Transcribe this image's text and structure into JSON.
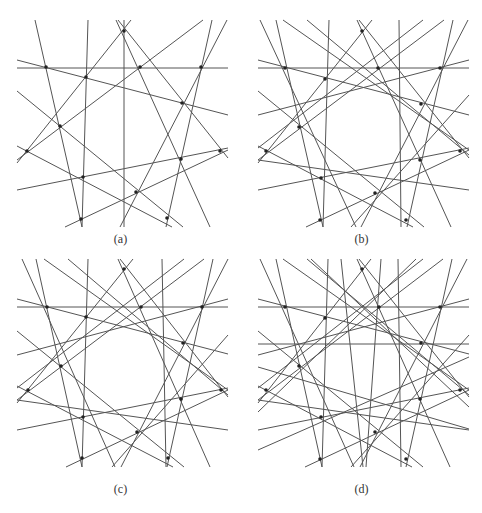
{
  "figure": {
    "stroke_color": "#555555",
    "dot_color": "#222222",
    "panels": [
      {
        "id": "a",
        "caption": "(a)",
        "offset": [
          0,
          0
        ],
        "caption_y": 232,
        "lines": [
          [
            17,
            68,
            228,
            68
          ],
          [
            17,
            60,
            228,
            115
          ],
          [
            35,
            20,
            82,
            227
          ],
          [
            88,
            20,
            82,
            227
          ],
          [
            124,
            20,
            124,
            227
          ],
          [
            116,
            20,
            210,
            227
          ],
          [
            118,
            20,
            228,
            158
          ],
          [
            131,
            20,
            17,
            163
          ],
          [
            203,
            20,
            17,
            160
          ],
          [
            212,
            20,
            166,
            227
          ],
          [
            227,
            20,
            120,
            227
          ],
          [
            17,
            91,
            183,
            227
          ],
          [
            17,
            190,
            228,
            148
          ],
          [
            65,
            227,
            228,
            150
          ],
          [
            17,
            146,
            172,
            227
          ]
        ],
        "dots": [
          [
            46,
            67
          ],
          [
            124,
            31
          ],
          [
            140,
            67
          ],
          [
            201,
            67
          ],
          [
            86,
            77
          ],
          [
            182,
            103
          ],
          [
            60,
            126
          ],
          [
            27,
            151
          ],
          [
            181,
            159
          ],
          [
            220,
            151
          ],
          [
            83,
            177
          ],
          [
            136,
            192
          ],
          [
            81,
            219
          ],
          [
            167,
            218
          ]
        ]
      },
      {
        "id": "b",
        "caption": "(b)",
        "offset": [
          241,
          0
        ],
        "caption_y": 232,
        "lines": [
          [
            17,
            68,
            228,
            68
          ],
          [
            17,
            60,
            228,
            115
          ],
          [
            35,
            20,
            82,
            227
          ],
          [
            88,
            20,
            82,
            227
          ],
          [
            116,
            20,
            210,
            227
          ],
          [
            118,
            20,
            228,
            158
          ],
          [
            131,
            20,
            17,
            163
          ],
          [
            203,
            20,
            17,
            160
          ],
          [
            212,
            20,
            166,
            227
          ],
          [
            227,
            20,
            120,
            227
          ],
          [
            17,
            91,
            183,
            227
          ],
          [
            17,
            190,
            228,
            148
          ],
          [
            65,
            227,
            228,
            150
          ],
          [
            17,
            146,
            172,
            227
          ],
          [
            19,
            20,
            115,
            227
          ],
          [
            42,
            20,
            228,
            150
          ],
          [
            17,
            115,
            228,
            60
          ],
          [
            17,
            160,
            228,
            190
          ],
          [
            158,
            20,
            160,
            227
          ],
          [
            228,
            95,
            110,
            227
          ],
          [
            17,
            148,
            182,
            20
          ],
          [
            228,
            155,
            66,
            20
          ]
        ],
        "dots": [
          [
            44,
            68
          ],
          [
            121,
            31
          ],
          [
            137,
            68
          ],
          [
            199,
            68
          ],
          [
            84,
            79
          ],
          [
            180,
            104
          ],
          [
            58,
            127
          ],
          [
            25,
            151
          ],
          [
            179,
            160
          ],
          [
            219,
            151
          ],
          [
            80,
            178
          ],
          [
            134,
            193
          ],
          [
            79,
            220
          ],
          [
            165,
            220
          ]
        ]
      },
      {
        "id": "c",
        "caption": "(c)",
        "offset": [
          0,
          247
        ],
        "caption_y": 235,
        "lines": [
          [
            17,
            60,
            228,
            60
          ],
          [
            17,
            52,
            228,
            107
          ],
          [
            36,
            12,
            82,
            220
          ],
          [
            88,
            12,
            82,
            220
          ],
          [
            118,
            12,
            210,
            220
          ],
          [
            120,
            12,
            228,
            150
          ],
          [
            133,
            12,
            17,
            156
          ],
          [
            204,
            12,
            17,
            153
          ],
          [
            213,
            12,
            167,
            220
          ],
          [
            228,
            12,
            121,
            220
          ],
          [
            17,
            84,
            184,
            220
          ],
          [
            17,
            183,
            228,
            141
          ],
          [
            66,
            220,
            228,
            143
          ],
          [
            17,
            139,
            173,
            220
          ],
          [
            22,
            12,
            115,
            220
          ],
          [
            44,
            12,
            228,
            143
          ],
          [
            17,
            108,
            228,
            52
          ],
          [
            17,
            153,
            228,
            183
          ],
          [
            162,
            12,
            166,
            220
          ],
          [
            228,
            88,
            112,
            220
          ],
          [
            17,
            141,
            184,
            12
          ],
          [
            228,
            148,
            68,
            12
          ]
        ],
        "dots": [
          [
            47,
            60
          ],
          [
            124,
            22
          ],
          [
            141,
            60
          ],
          [
            202,
            60
          ],
          [
            86,
            70
          ],
          [
            183,
            96
          ],
          [
            61,
            119
          ],
          [
            28,
            143
          ],
          [
            181,
            152
          ],
          [
            221,
            143
          ],
          [
            83,
            170
          ],
          [
            137,
            185
          ],
          [
            82,
            211
          ],
          [
            168,
            211
          ]
        ]
      },
      {
        "id": "d",
        "caption": "(d)",
        "offset": [
          241,
          247
        ],
        "caption_y": 235,
        "lines": [
          [
            17,
            60,
            228,
            60
          ],
          [
            17,
            97,
            228,
            97
          ],
          [
            17,
            52,
            228,
            107
          ],
          [
            35,
            12,
            81,
            220
          ],
          [
            87,
            12,
            81,
            220
          ],
          [
            116,
            12,
            209,
            220
          ],
          [
            118,
            12,
            228,
            150
          ],
          [
            130,
            12,
            17,
            156
          ],
          [
            202,
            12,
            17,
            153
          ],
          [
            211,
            12,
            165,
            220
          ],
          [
            226,
            12,
            119,
            220
          ],
          [
            17,
            84,
            182,
            220
          ],
          [
            17,
            183,
            228,
            141
          ],
          [
            64,
            220,
            228,
            143
          ],
          [
            17,
            139,
            171,
            220
          ],
          [
            19,
            12,
            113,
            220
          ],
          [
            42,
            12,
            228,
            143
          ],
          [
            17,
            108,
            228,
            52
          ],
          [
            17,
            153,
            228,
            183
          ],
          [
            157,
            12,
            160,
            220
          ],
          [
            228,
            88,
            110,
            220
          ],
          [
            17,
            141,
            182,
            12
          ],
          [
            228,
            148,
            66,
            12
          ],
          [
            70,
            12,
            228,
            160
          ],
          [
            175,
            12,
            17,
            165
          ],
          [
            17,
            120,
            228,
            182
          ],
          [
            17,
            203,
            228,
            110
          ],
          [
            100,
            12,
            122,
            220
          ],
          [
            140,
            12,
            125,
            220
          ]
        ],
        "dots": [
          [
            44,
            60
          ],
          [
            121,
            22
          ],
          [
            138,
            60
          ],
          [
            199,
            60
          ],
          [
            84,
            71
          ],
          [
            180,
            96
          ],
          [
            58,
            119
          ],
          [
            25,
            143
          ],
          [
            179,
            152
          ],
          [
            219,
            143
          ],
          [
            80,
            170
          ],
          [
            134,
            185
          ],
          [
            79,
            212
          ],
          [
            165,
            212
          ]
        ]
      }
    ]
  }
}
